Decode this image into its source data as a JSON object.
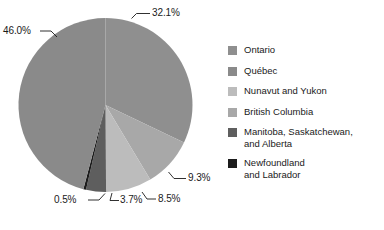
{
  "chart_data": {
    "type": "pie",
    "title": "",
    "subtitle": "",
    "xlabel": "",
    "ylabel": "",
    "grid": false,
    "legend_position": "right",
    "start_angle_deg": 0,
    "direction": "clockwise",
    "categories": [
      "Ontario",
      "Québec",
      "Nunavut and Yukon",
      "British Columbia",
      "Manitoba, Saskatchewan, and Alberta",
      "Newfoundland and Labrador"
    ],
    "values": [
      32.1,
      46.0,
      8.5,
      9.3,
      3.7,
      0.5
    ],
    "value_labels": [
      "32.1%",
      "46.0%",
      "8.5%",
      "9.3%",
      "3.7%",
      "0.5%"
    ],
    "colors": [
      "#8f8f8f",
      "#8a8a8a",
      "#bcbcbc",
      "#a8a8a8",
      "#5e5e5e",
      "#1c1c1c"
    ],
    "slices": [
      {
        "name": "Ontario",
        "value": 32.1,
        "label": "32.1%",
        "color": "#8f8f8f",
        "start_deg": 0,
        "end_deg": 115.56
      },
      {
        "name": "British Columbia",
        "value": 9.3,
        "label": "9.3%",
        "color": "#a8a8a8",
        "start_deg": 115.56,
        "end_deg": 149.04
      },
      {
        "name": "Nunavut and Yukon",
        "value": 8.5,
        "label": "8.5%",
        "color": "#bcbcbc",
        "start_deg": 149.04,
        "end_deg": 179.64
      },
      {
        "name": "Manitoba, Saskatchewan, and Alberta",
        "value": 3.7,
        "label": "3.7%",
        "color": "#5e5e5e",
        "start_deg": 179.64,
        "end_deg": 192.96
      },
      {
        "name": "Newfoundland and Labrador",
        "value": 0.5,
        "label": "0.5%",
        "color": "#1c1c1c",
        "start_deg": 192.96,
        "end_deg": 194.76
      },
      {
        "name": "Québec",
        "value": 46.0,
        "label": "46.0%",
        "color": "#8a8a8a",
        "start_deg": 194.76,
        "end_deg": 360.0
      }
    ]
  },
  "callouts": {
    "ontario": "32.1%",
    "quebec": "46.0%",
    "british_columbia": "9.3%",
    "nunavut_yukon": "8.5%",
    "manitoba_sask_alberta": "3.7%",
    "newfoundland_labrador": "0.5%"
  },
  "legend": {
    "items": [
      {
        "label": "Ontario",
        "color": "#8f8f8f"
      },
      {
        "label": "Québec",
        "color": "#8a8a8a"
      },
      {
        "label": "Nunavut and Yukon",
        "color": "#bcbcbc"
      },
      {
        "label": "British Columbia",
        "color": "#a8a8a8"
      },
      {
        "label": "Manitoba, Saskatchewan,\nand Alberta",
        "color": "#5e5e5e"
      },
      {
        "label": "Newfoundland\nand Labrador",
        "color": "#1c1c1c"
      }
    ]
  }
}
